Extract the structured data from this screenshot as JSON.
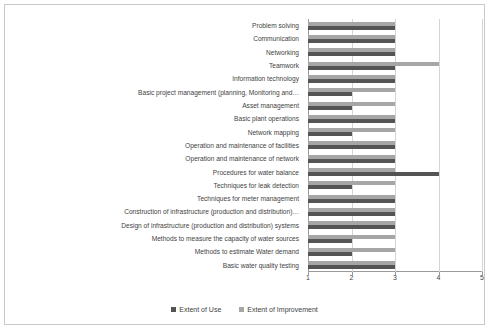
{
  "chart_data": {
    "type": "bar",
    "orientation": "horizontal",
    "title": "",
    "xlabel": "",
    "ylabel": "",
    "xlim": [
      1,
      5
    ],
    "xticks": [
      "1",
      "2",
      "3",
      "4",
      "5"
    ],
    "grid": true,
    "legend_position": "bottom",
    "categories": [
      "Problem solving",
      "Communication",
      "Networking",
      "Teamwork",
      "Information technology",
      "Basic project management (planning, Monitoring and…",
      "Asset management",
      "Basic plant operations",
      "Network mapping",
      "Operation and maintenance of facilities",
      "Operation and maintenance of network",
      "Procedures for water balance",
      "Techniques  for leak detection",
      "Techniques for meter management",
      "Construction of infrastructure (production and distribution)…",
      "Design of infrastructure (production and distribution) systems",
      "Methods to measure the capacity of water sources",
      "Methods to estimate Water demand",
      "Basic water quality testing"
    ],
    "series": [
      {
        "name": "Extent of Use",
        "color": "#545454",
        "values": [
          3,
          3,
          3,
          3,
          3,
          2,
          2,
          3,
          2,
          3,
          3,
          4,
          2,
          3,
          3,
          3,
          2,
          2,
          3
        ]
      },
      {
        "name": "Extent of Improvement",
        "color": "#a6a6a6",
        "values": [
          3,
          3,
          3,
          4,
          3,
          3,
          3,
          3,
          3,
          3,
          3,
          3,
          3,
          3,
          3,
          3,
          3,
          3,
          3
        ]
      }
    ]
  },
  "legend": {
    "items": [
      {
        "label": "Extent of Use",
        "color": "#545454"
      },
      {
        "label": "Extent of Improvement",
        "color": "#a6a6a6"
      }
    ]
  }
}
